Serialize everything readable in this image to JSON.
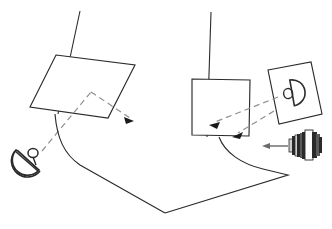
{
  "scene": {
    "title": "Optical link diagram",
    "background_color": "#ffffff",
    "ink_color": "#2b2b2b",
    "dashed_color": "#9a9a9a",
    "width": 332,
    "height": 229
  },
  "objects": {
    "left_mast": {
      "name": "left mast",
      "x1": 80,
      "y1": 11,
      "x2": 58,
      "y2": 114
    },
    "right_mast": {
      "name": "right mast",
      "x1": 211,
      "y1": 12,
      "x2": 207,
      "y2": 137
    },
    "left_panel": {
      "name": "left reflector panel",
      "points": "56,55 135,65 108,118 30,107",
      "label": "reflector panel"
    },
    "right_panel": {
      "name": "right reflector panel",
      "points": "192,79 250,80 249,136 192,135",
      "label": "reflector panel"
    },
    "photo_card": {
      "name": "dish photo card",
      "points": "268,70 311,62 322,114 279,124",
      "label": "dish image card"
    },
    "dish_left": {
      "name": "satellite dish",
      "cx": 28,
      "cy": 160,
      "r": 14,
      "label": "satellite dish"
    },
    "dish_card_icon": {
      "name": "dish icon on card",
      "cx": 297,
      "cy": 92,
      "r": 13
    },
    "camera": {
      "name": "camera lens",
      "x": 288,
      "y": 132,
      "w": 32,
      "h": 28,
      "label": "camera lens"
    }
  },
  "rays": {
    "incoming_left": {
      "name": "incoming ray to left panel",
      "style": "dashed",
      "path": "M 42,151 L 91,92"
    },
    "outgoing_left": {
      "name": "reflected ray from left panel",
      "style": "dashed",
      "path": "M 91,92 L 133,120"
    },
    "arrow_left": {
      "name": "left reflected arrowhead",
      "points": "133,120 126,115 124,122"
    },
    "card_to_panel": {
      "name": "ray from card to right panel",
      "style": "dashed",
      "path": "M 277,98 L 211,124"
    },
    "arrow_card_to_panel": {
      "name": "card ray arrowhead",
      "points": "211,124 219,122 215,129"
    },
    "card_to_panel_b": {
      "name": "second ray into right panel",
      "style": "dashed",
      "path": "M 272,112 L 233,135"
    },
    "arrow_card_to_panel_b": {
      "name": "second ray arrowhead",
      "points": "233,135 241,133 237,140"
    },
    "camera_arrow": {
      "name": "camera pointing arrow",
      "style": "solid",
      "path": "M 288,146 L 264,146"
    },
    "arrow_camera": {
      "name": "camera arrowhead",
      "points": "264,146 271,143 271,149"
    }
  },
  "cables": {
    "left_cable": {
      "name": "left cable",
      "path": "M 55,114 C 58,140 66,155 83,167 L 165,213"
    },
    "right_cable": {
      "name": "right cable",
      "path": "M 219,137 C 224,152 240,163 262,170 L 288,175 L 165,213"
    }
  }
}
